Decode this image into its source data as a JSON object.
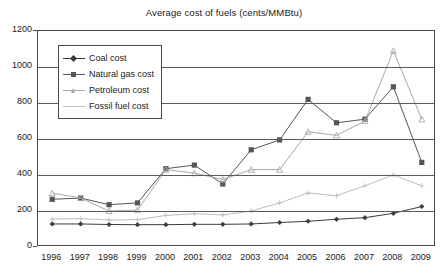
{
  "chart_data": {
    "type": "line",
    "title": "Average cost of fuels (cents/MMBtu)",
    "xlabel": "",
    "ylabel": "",
    "xlim": [
      1996,
      2009
    ],
    "ylim": [
      0,
      1200
    ],
    "ytick_step": 200,
    "grid": true,
    "legend_position": "upper-left-inside",
    "categories": [
      "1996",
      "1997",
      "1998",
      "1999",
      "2000",
      "2001",
      "2002",
      "2003",
      "2004",
      "2005",
      "2006",
      "2007",
      "2008",
      "2009"
    ],
    "yticks": [
      "0",
      "200",
      "400",
      "600",
      "800",
      "1000",
      "1200"
    ],
    "series": [
      {
        "name": "Coal cost",
        "color": "#3c3c3c",
        "marker": "diamond",
        "values": [
          128,
          128,
          125,
          124,
          124,
          126,
          126,
          128,
          136,
          143,
          154,
          163,
          187,
          225
        ]
      },
      {
        "name": "Natural gas cost",
        "color": "#555555",
        "marker": "square",
        "values": [
          265,
          272,
          235,
          245,
          435,
          455,
          350,
          540,
          595,
          820,
          690,
          710,
          890,
          470
        ]
      },
      {
        "name": "Petroleum cost",
        "color": "#a8a8a8",
        "marker": "triangle",
        "values": [
          300,
          272,
          200,
          205,
          430,
          410,
          375,
          430,
          430,
          640,
          620,
          700,
          1090,
          710
        ]
      },
      {
        "name": "Fossil fuel cost",
        "color": "#bdbdbd",
        "marker": "cross",
        "values": [
          155,
          158,
          150,
          152,
          175,
          185,
          178,
          200,
          245,
          300,
          285,
          340,
          400,
          340
        ]
      }
    ]
  },
  "legend": {
    "items": [
      {
        "label": "Coal cost"
      },
      {
        "label": "Natural gas cost"
      },
      {
        "label": "Petroleum cost"
      },
      {
        "label": "Fossil fuel cost"
      }
    ]
  }
}
